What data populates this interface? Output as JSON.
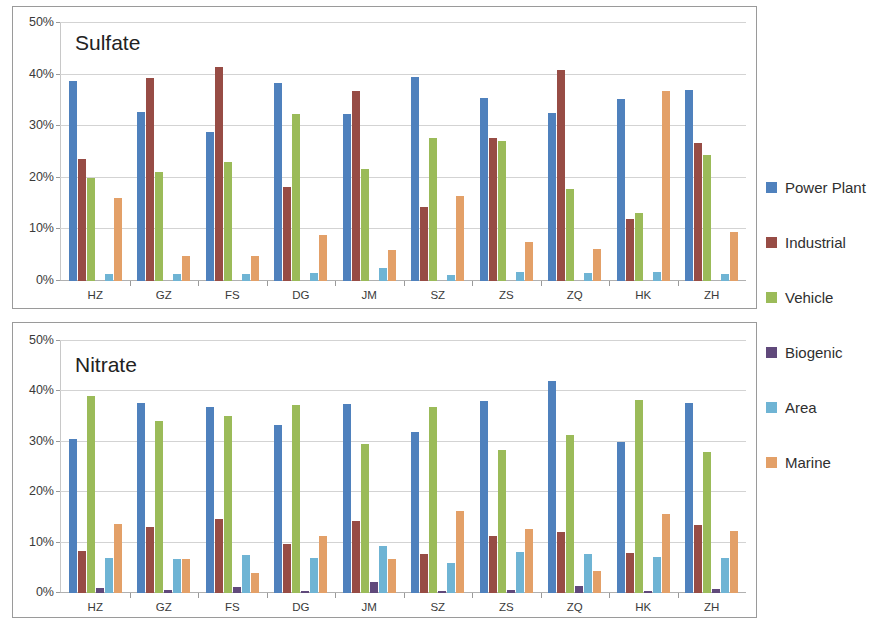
{
  "legend": {
    "position": "right",
    "items": [
      {
        "label": "Power Plant",
        "color": "#4f81bd"
      },
      {
        "label": "Industrial",
        "color": "#974c45"
      },
      {
        "label": "Vehicle",
        "color": "#9bbb59"
      },
      {
        "label": "Biogenic",
        "color": "#60497b"
      },
      {
        "label": "Area",
        "color": "#6fb4d4"
      },
      {
        "label": "Marine",
        "color": "#e3a068"
      }
    ]
  },
  "axis": {
    "ticks": [
      "0%",
      "10%",
      "20%",
      "30%",
      "40%",
      "50%"
    ],
    "tick_values": [
      0,
      10,
      20,
      30,
      40,
      50
    ],
    "ymin": 0,
    "ymax": 50
  },
  "chart_data": [
    {
      "type": "bar",
      "title": "Sulfate",
      "xlabel": "",
      "ylabel": "",
      "ylim": [
        0,
        50
      ],
      "grid": true,
      "legend_position": "right",
      "categories": [
        "HZ",
        "GZ",
        "FS",
        "DG",
        "JM",
        "SZ",
        "ZS",
        "ZQ",
        "HK",
        "ZH"
      ],
      "series": [
        {
          "name": "Power Plant",
          "color": "#4f81bd",
          "values": [
            38.7,
            32.7,
            28.8,
            38.3,
            32.3,
            39.6,
            35.4,
            32.6,
            35.2,
            37.0
          ]
        },
        {
          "name": "Industrial",
          "color": "#974c45",
          "values": [
            23.6,
            39.3,
            41.5,
            18.2,
            36.9,
            14.4,
            27.7,
            40.8,
            12.1,
            26.7
          ]
        },
        {
          "name": "Vehicle",
          "color": "#9bbb59",
          "values": [
            19.9,
            21.2,
            23.1,
            32.4,
            21.8,
            27.7,
            27.1,
            17.8,
            13.1,
            24.5
          ]
        },
        {
          "name": "Biogenic",
          "color": "#60497b",
          "values": [
            0.0,
            0.0,
            0.0,
            0.0,
            0.0,
            0.0,
            0.0,
            0.0,
            0.0,
            0.0
          ]
        },
        {
          "name": "Area",
          "color": "#6fb4d4",
          "values": [
            1.4,
            1.4,
            1.4,
            1.5,
            2.6,
            1.1,
            1.8,
            1.5,
            1.7,
            1.4
          ]
        },
        {
          "name": "Marine",
          "color": "#e3a068",
          "values": [
            16.0,
            4.9,
            4.8,
            9.0,
            6.0,
            16.5,
            7.6,
            6.3,
            36.8,
            9.5
          ]
        }
      ]
    },
    {
      "type": "bar",
      "title": "Nitrate",
      "xlabel": "",
      "ylabel": "",
      "ylim": [
        0,
        50
      ],
      "grid": true,
      "legend_position": "right",
      "categories": [
        "HZ",
        "GZ",
        "FS",
        "DG",
        "JM",
        "SZ",
        "ZS",
        "ZQ",
        "HK",
        "ZH"
      ],
      "series": [
        {
          "name": "Power Plant",
          "color": "#4f81bd",
          "values": [
            30.5,
            37.7,
            37.0,
            33.4,
            37.5,
            32.0,
            38.1,
            42.0,
            29.9,
            37.8
          ]
        },
        {
          "name": "Industrial",
          "color": "#974c45",
          "values": [
            8.4,
            13.1,
            14.6,
            9.7,
            14.2,
            7.8,
            11.3,
            12.2,
            7.9,
            13.4
          ]
        },
        {
          "name": "Vehicle",
          "color": "#9bbb59",
          "values": [
            39.1,
            34.2,
            35.1,
            37.4,
            29.5,
            37.0,
            28.3,
            31.4,
            38.2,
            27.9
          ]
        },
        {
          "name": "Biogenic",
          "color": "#60497b",
          "values": [
            1.0,
            0.5,
            1.2,
            0.4,
            2.2,
            0.4,
            0.5,
            1.4,
            0.4,
            0.8
          ]
        },
        {
          "name": "Area",
          "color": "#6fb4d4",
          "values": [
            7.0,
            6.8,
            7.6,
            6.9,
            9.3,
            5.9,
            8.2,
            7.8,
            7.1,
            6.9
          ]
        },
        {
          "name": "Marine",
          "color": "#e3a068",
          "values": [
            13.7,
            6.8,
            3.9,
            11.4,
            6.8,
            16.3,
            12.8,
            4.3,
            15.6,
            12.4
          ]
        }
      ]
    }
  ]
}
